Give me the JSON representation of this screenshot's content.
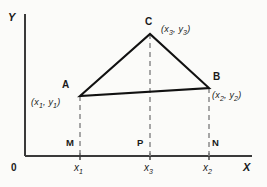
{
  "figure": {
    "type": "geometry-diagram"
  },
  "axes": {
    "x_label": "X",
    "y_label": "Y",
    "origin_label": "0"
  },
  "vertices": {
    "a": {
      "name": "A",
      "coord": "(x₁, y₁)",
      "x_sym": "x",
      "x_sub": "1",
      "y_sym": "y",
      "y_sub": "1"
    },
    "b": {
      "name": "B",
      "coord": "(x₂, y₂)",
      "x_sym": "x",
      "x_sub": "2",
      "y_sym": "y",
      "y_sub": "2"
    },
    "c": {
      "name": "C",
      "coord": "(x₃, y₃)",
      "x_sym": "x",
      "x_sub": "3",
      "y_sym": "y",
      "y_sub": "3"
    }
  },
  "feet": {
    "m": "M",
    "p": "P",
    "n": "N"
  },
  "ticks": {
    "x1": {
      "sym": "x",
      "sub": "1"
    },
    "x3": {
      "sym": "x",
      "sub": "3"
    },
    "x2": {
      "sym": "x",
      "sub": "2"
    }
  },
  "colors": {
    "line": "#111111",
    "axis": "#3a3a3a",
    "dashed": "#8a8a8a",
    "background": "#fbfbf9"
  },
  "geometry": {
    "axis_origin_x": 25,
    "axis_baseline_y": 156,
    "a_x": 80,
    "a_y": 96,
    "b_x": 209,
    "b_y": 88,
    "c_x": 150,
    "c_y": 34
  }
}
